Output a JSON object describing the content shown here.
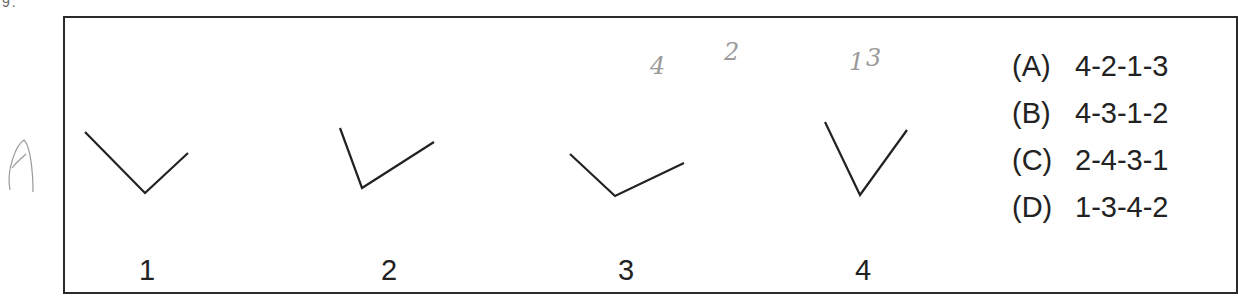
{
  "question": {
    "fragment_top_left": "9."
  },
  "figures": [
    {
      "label": "1",
      "points": [
        [
          85,
          132
        ],
        [
          145,
          193
        ],
        [
          188,
          153
        ]
      ],
      "label_x": 147
    },
    {
      "label": "2",
      "points": [
        [
          340,
          128
        ],
        [
          362,
          188
        ],
        [
          434,
          142
        ]
      ],
      "label_x": 389
    },
    {
      "label": "3",
      "points": [
        [
          570,
          154
        ],
        [
          615,
          196
        ],
        [
          684,
          163
        ]
      ],
      "label_x": 626
    },
    {
      "label": "4",
      "points": [
        [
          825,
          122
        ],
        [
          860,
          195
        ],
        [
          907,
          130
        ]
      ],
      "label_x": 863
    }
  ],
  "handwriting": {
    "margin_mark": "A",
    "annotations": [
      "4",
      "2",
      "1",
      "3"
    ]
  },
  "options": [
    {
      "letter": "(A)",
      "sequence": "4-2-1-3"
    },
    {
      "letter": "(B)",
      "sequence": "4-3-1-2"
    },
    {
      "letter": "(C)",
      "sequence": "2-4-3-1"
    },
    {
      "letter": "(D)",
      "sequence": "1-3-4-2"
    }
  ],
  "colors": {
    "ink": "#222222",
    "pencil": "#9a9a9a",
    "border": "#2a2a2a"
  }
}
